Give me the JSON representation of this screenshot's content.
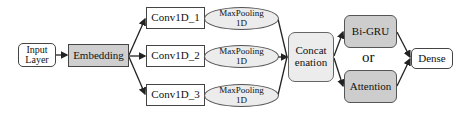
{
  "diagram": {
    "nodes": {
      "input": {
        "line1": "Input",
        "line2": "Layer"
      },
      "embedding": {
        "label": "Embedding"
      },
      "conv1": {
        "label": "Conv1D_1"
      },
      "conv2": {
        "label": "Conv1D_2"
      },
      "conv3": {
        "label": "Conv1D_3"
      },
      "pool1": {
        "line1": "MaxPooling",
        "line2": "1D"
      },
      "pool2": {
        "line1": "MaxPooling",
        "line2": "1D"
      },
      "pool3": {
        "line1": "MaxPooling",
        "line2": "1D"
      },
      "concat": {
        "line1": "Concat",
        "line2": "enation"
      },
      "bigru": {
        "label": "Bi-GRU"
      },
      "attention": {
        "label": "Attention"
      },
      "dense": {
        "label": "Dense"
      }
    },
    "or_label": "or",
    "edges": [
      [
        "input",
        "embedding"
      ],
      [
        "embedding",
        "conv1"
      ],
      [
        "embedding",
        "conv2"
      ],
      [
        "embedding",
        "conv3"
      ],
      [
        "conv1",
        "pool1"
      ],
      [
        "conv2",
        "pool2"
      ],
      [
        "conv3",
        "pool3"
      ],
      [
        "pool1",
        "concat"
      ],
      [
        "pool2",
        "concat"
      ],
      [
        "pool3",
        "concat"
      ],
      [
        "concat",
        "bigru"
      ],
      [
        "concat",
        "attention"
      ],
      [
        "bigru",
        "dense"
      ],
      [
        "attention",
        "dense"
      ]
    ]
  }
}
